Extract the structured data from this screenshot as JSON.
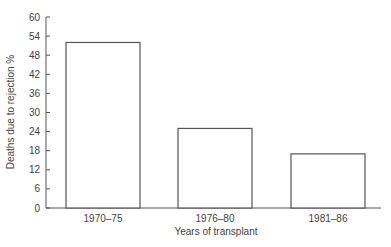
{
  "chart_data": {
    "type": "bar",
    "title": "",
    "xlabel": "Years of transplant",
    "ylabel": "Deaths due to rejection %",
    "categories": [
      "1970–75",
      "1976–80",
      "1981–86"
    ],
    "values": [
      52,
      25,
      17
    ],
    "ylim": [
      0,
      60
    ],
    "yticks": [
      0,
      6,
      12,
      18,
      24,
      30,
      36,
      42,
      48,
      54,
      60
    ],
    "grid": false,
    "legend": null,
    "colors": {
      "bar_fill": "#ffffff",
      "bar_stroke": "#555555",
      "axis": "#555555"
    }
  }
}
